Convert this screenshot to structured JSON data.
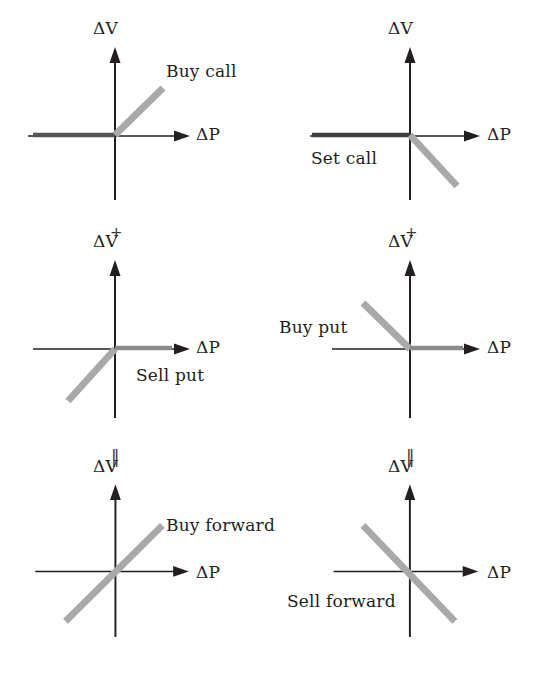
{
  "figure": {
    "background": "#ffffff",
    "axis_color": "#231f20",
    "payoff_gray": "#a9a9a9",
    "payoff_dark": "#3a3a3a",
    "width": 541,
    "height": 685
  },
  "axis_labels": {
    "vertical": "ΔV",
    "horizontal": "ΔP"
  },
  "operators": {
    "plus": "+",
    "equals": "‖"
  },
  "panels": [
    {
      "id": "buy-call",
      "label": "Buy call",
      "row": 0,
      "col": 0,
      "vertical_axis_label": "ΔV",
      "horizontal_axis_label": "ΔP",
      "payoff_shape": "flat-left-then-up-right",
      "slope_sign": "positive",
      "kink_at_origin": true
    },
    {
      "id": "set-call",
      "label": "Set call",
      "row": 0,
      "col": 1,
      "vertical_axis_label": "ΔV",
      "horizontal_axis_label": "ΔP",
      "payoff_shape": "flat-left-then-down-right",
      "slope_sign": "negative",
      "kink_at_origin": true
    },
    {
      "id": "sell-put",
      "label": "Sell put",
      "row": 1,
      "col": 0,
      "vertical_axis_label": "ΔV",
      "horizontal_axis_label": "ΔP",
      "payoff_shape": "up-from-lower-left-then-flat-right",
      "slope_sign": "positive",
      "kink_at_origin": true
    },
    {
      "id": "buy-put",
      "label": "Buy put",
      "row": 1,
      "col": 1,
      "vertical_axis_label": "ΔV",
      "horizontal_axis_label": "ΔP",
      "payoff_shape": "down-from-upper-left-then-flat-right",
      "slope_sign": "negative",
      "kink_at_origin": true
    },
    {
      "id": "buy-forward",
      "label": "Buy forward",
      "row": 2,
      "col": 0,
      "vertical_axis_label": "ΔV",
      "horizontal_axis_label": "ΔP",
      "payoff_shape": "straight-line-up-right",
      "slope_sign": "positive",
      "kink_at_origin": false
    },
    {
      "id": "sell-forward",
      "label": "Sell forward",
      "row": 2,
      "col": 1,
      "vertical_axis_label": "ΔV",
      "horizontal_axis_label": "ΔP",
      "payoff_shape": "straight-line-down-right",
      "slope_sign": "negative",
      "kink_at_origin": false
    }
  ]
}
